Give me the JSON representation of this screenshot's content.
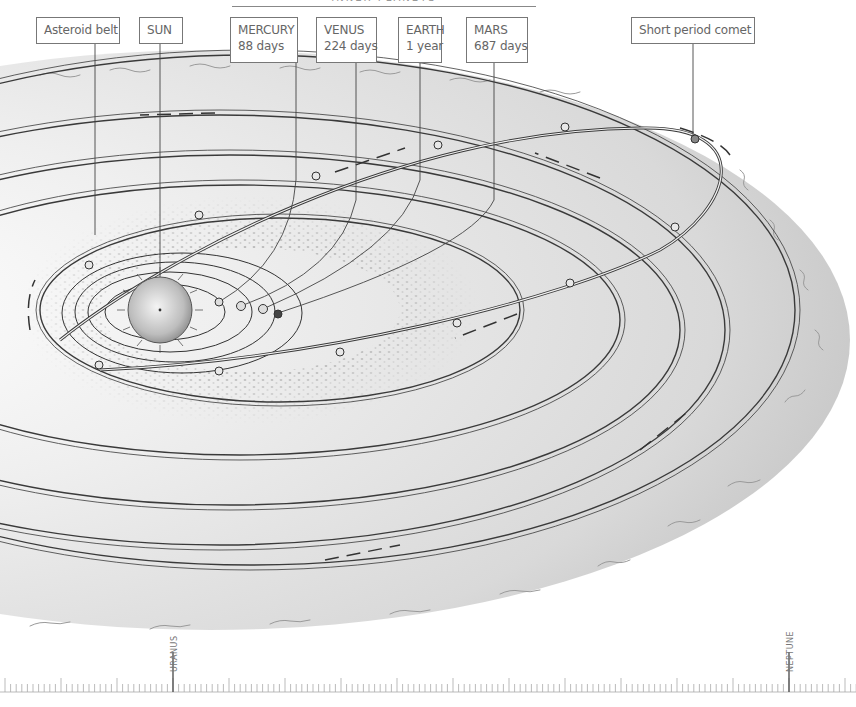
{
  "header": {
    "title": "INNER PLANETS"
  },
  "labels": {
    "asteroid_belt": {
      "line1": "Asteroid belt"
    },
    "sun": {
      "line1": "SUN"
    },
    "mercury": {
      "line1": "MERCURY",
      "line2": "88 days"
    },
    "venus": {
      "line1": "VENUS",
      "line2": "224 days"
    },
    "earth": {
      "line1": "EARTH",
      "line2": "1 year"
    },
    "mars": {
      "line1": "MARS",
      "line2": "687 days"
    },
    "comet": {
      "line1": "Short period comet"
    }
  },
  "ruler": {
    "markers": [
      {
        "name": "URANUS",
        "x": 173
      },
      {
        "name": "NEPTUNE",
        "x": 789
      }
    ],
    "major_tick_spacing": 56,
    "minor_tick_spacing": 5.6
  },
  "colors": {
    "ink": "#3a3a3a",
    "shade": "#bdbdbd",
    "paper": "#ffffff",
    "label_border": "#777777"
  }
}
